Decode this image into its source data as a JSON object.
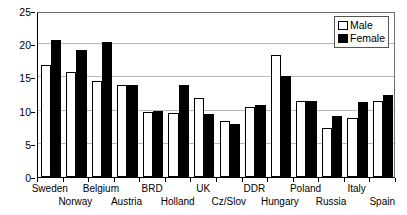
{
  "chart_data": {
    "type": "bar",
    "title": "",
    "xlabel": "",
    "ylabel": "",
    "ylim": [
      0,
      25
    ],
    "yticks": [
      0,
      5,
      10,
      15,
      20,
      25
    ],
    "grid": true,
    "legend_position": "top-right",
    "categories": [
      "Sweden",
      "Norway",
      "Belgium",
      "Austria",
      "BRD",
      "Holland",
      "UK",
      "Cz/Slov",
      "DDR",
      "Hungary",
      "Poland",
      "Russia",
      "Italy",
      "Spain"
    ],
    "series": [
      {
        "name": "Male",
        "color": "#ffffff",
        "values": [
          16.8,
          15.8,
          14.5,
          13.8,
          9.8,
          9.7,
          11.9,
          8.4,
          10.5,
          18.4,
          11.4,
          7.4,
          8.9,
          11.5
        ]
      },
      {
        "name": "Female",
        "color": "#000000",
        "values": [
          20.7,
          19.2,
          20.3,
          13.9,
          9.9,
          13.8,
          9.5,
          8.0,
          10.8,
          15.2,
          11.5,
          9.2,
          11.3,
          12.3
        ]
      }
    ]
  },
  "legend": {
    "items": [
      {
        "label": "Male",
        "swatch": "male-swatch"
      },
      {
        "label": "Female",
        "swatch": "female-swatch"
      }
    ]
  },
  "axis": {
    "y_tick_labels": [
      "25",
      "20",
      "15",
      "10",
      "5",
      "0"
    ]
  }
}
